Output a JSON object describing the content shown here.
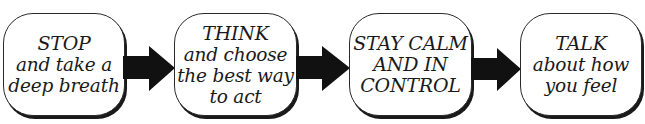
{
  "diagram": {
    "type": "flow",
    "direction": "left-to-right",
    "colors": {
      "background": "#ffffff",
      "box_fill": "#ffffff",
      "box_border": "#2a2a2a",
      "text": "#1a1a1a",
      "arrow": "#111111"
    },
    "steps": [
      {
        "headline": "STOP",
        "lines": [
          "STOP",
          "and take a",
          "deep breath"
        ]
      },
      {
        "headline": "THINK",
        "lines": [
          "THINK",
          "and choose",
          "the best way",
          "to act"
        ]
      },
      {
        "headline": "STAY CALM AND IN CONTROL",
        "lines": [
          "STAY CALM",
          "AND IN",
          "CONTROL"
        ]
      },
      {
        "headline": "TALK",
        "lines": [
          "TALK",
          "about how",
          "you feel"
        ]
      }
    ],
    "connectors": [
      {
        "from": 0,
        "to": 1,
        "icon": "right-arrow-icon"
      },
      {
        "from": 1,
        "to": 2,
        "icon": "right-arrow-icon"
      },
      {
        "from": 2,
        "to": 3,
        "icon": "right-arrow-icon"
      }
    ]
  }
}
